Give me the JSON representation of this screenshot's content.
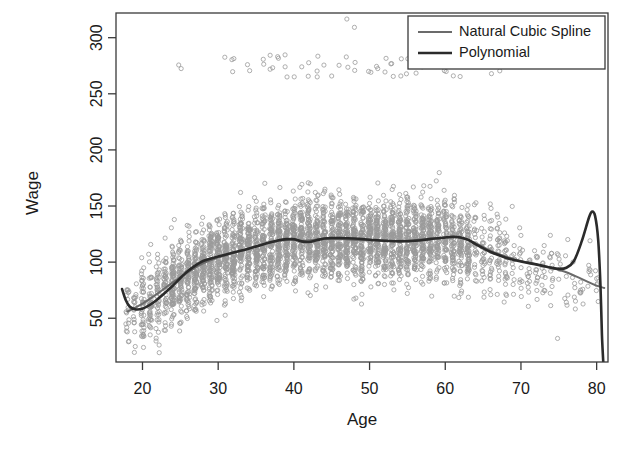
{
  "chart_data": {
    "type": "scatter",
    "title": "",
    "subtitle": "",
    "xlabel": "Age",
    "ylabel": "Wage",
    "xlim": [
      16.5,
      81.5
    ],
    "ylim": [
      11,
      322
    ],
    "xticks": [
      20,
      30,
      40,
      50,
      60,
      70,
      80
    ],
    "xtick_labels": [
      "20",
      "30",
      "40",
      "50",
      "60",
      "70",
      "80"
    ],
    "yticks": [
      50,
      100,
      150,
      200,
      250,
      300
    ],
    "ytick_labels": [
      "50",
      "100",
      "150",
      "200",
      "250",
      "300"
    ],
    "grid": false,
    "frame": true,
    "legend_position": "top-right",
    "point_style": {
      "marker": "open-circle",
      "color": "#9a9a9a",
      "radius": 2.1,
      "stroke_width": 0.8
    },
    "annotations": [
      "High-wage outlier band near 270-300",
      "Polynomial fit spikes to ~145 near age 79 then drops off the plot"
    ],
    "series": [
      {
        "name": "Natural Cubic Spline",
        "type": "line",
        "color": "#6b6b6b",
        "linewidth": 2.0,
        "x": [
          18,
          20,
          22,
          24,
          26,
          28,
          30,
          32,
          34,
          36,
          38,
          40,
          41,
          42,
          44,
          46,
          48,
          50,
          52,
          54,
          56,
          58,
          60,
          61,
          62,
          64,
          66,
          68,
          70,
          72,
          74,
          76,
          78,
          80,
          81
        ],
        "y": [
          56,
          63,
          72,
          82,
          91,
          99,
          104,
          108,
          112,
          116,
          119,
          120,
          119,
          119.5,
          120.5,
          120.5,
          120,
          119.5,
          119,
          119,
          119.5,
          121,
          122,
          122.5,
          122,
          117,
          110,
          105,
          101,
          98,
          95,
          91,
          85,
          79,
          77
        ]
      },
      {
        "name": "Polynomial",
        "type": "line",
        "color": "#2b2b2b",
        "linewidth": 2.6,
        "x": [
          17.3,
          17.8,
          18.3,
          19,
          20,
          21,
          22,
          24,
          26,
          28,
          30,
          32,
          34,
          36,
          38,
          39,
          40,
          41,
          42,
          43,
          44,
          45,
          46,
          48,
          50,
          52,
          54,
          56,
          58,
          60,
          61,
          62,
          63,
          64,
          66,
          68,
          70,
          72,
          74,
          75,
          76,
          77,
          78,
          79,
          79.4,
          79.8,
          80.2,
          80.5,
          80.7,
          80.9
        ],
        "y": [
          76,
          66,
          60.5,
          58,
          58.5,
          62,
          67,
          79,
          92,
          101,
          105,
          108.5,
          112,
          116,
          119.5,
          120.5,
          120.5,
          118.5,
          118,
          119.5,
          121,
          121.5,
          121.5,
          121,
          120,
          119,
          118.5,
          119,
          120.5,
          122,
          122.5,
          122,
          120,
          116,
          109,
          104,
          100.5,
          98,
          95,
          94,
          95,
          101,
          118,
          140,
          145,
          141,
          120,
          80,
          35,
          8
        ]
      }
    ],
    "scatter_note": "Wage observations plotted at integer ages; dense vertical columns between ages 25 and 62"
  },
  "legend": {
    "entries": [
      {
        "label": "Natural Cubic Spline",
        "color": "#6b6b6b"
      },
      {
        "label": "Polynomial",
        "color": "#2b2b2b"
      }
    ]
  }
}
